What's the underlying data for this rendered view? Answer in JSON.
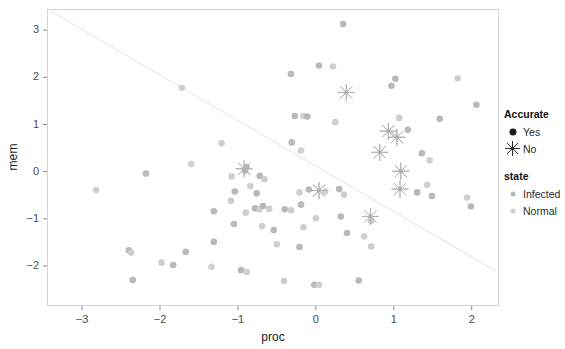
{
  "chart_data": {
    "type": "scatter",
    "title": "",
    "xlabel": "proc",
    "ylabel": "mem",
    "xlim": [
      -3.45,
      2.35
    ],
    "ylim": [
      -2.85,
      3.45
    ],
    "xticks": [
      -3,
      -2,
      -1,
      0,
      1,
      2
    ],
    "xticklabels": [
      "-3",
      "-2",
      "-1",
      "0",
      "1",
      "2"
    ],
    "yticks": [
      -2,
      -1,
      0,
      1,
      2,
      3
    ],
    "yticklabels": [
      "-2",
      "-1",
      "0",
      "1",
      "2",
      "3"
    ],
    "grid": false,
    "panel_border": true,
    "legend_position": "right",
    "reference_line": {
      "type": "line",
      "x": [
        -3.39,
        2.31
      ],
      "y": [
        3.39,
        -2.11
      ],
      "color": "#e8e8e8",
      "width": 1.2
    },
    "marker_colors": {
      "infected": "#b9b9b9",
      "normal": "#cfcfcf",
      "star": "#b0b0b0",
      "legend_yes": "#1a1a1a"
    },
    "series": [
      {
        "name": "Accurate = Yes",
        "marker": "circle",
        "points": [
          {
            "x": 0.35,
            "y": 3.13,
            "state": "Infected"
          },
          {
            "x": 0.04,
            "y": 2.25,
            "state": "Infected"
          },
          {
            "x": 0.22,
            "y": 2.23,
            "state": "Normal"
          },
          {
            "x": -0.32,
            "y": 2.07,
            "state": "Infected"
          },
          {
            "x": 1.02,
            "y": 1.97,
            "state": "Infected"
          },
          {
            "x": 1.82,
            "y": 1.98,
            "state": "Normal"
          },
          {
            "x": 0.97,
            "y": 1.82,
            "state": "Infected"
          },
          {
            "x": -1.72,
            "y": 1.78,
            "state": "Normal"
          },
          {
            "x": 2.06,
            "y": 1.42,
            "state": "Infected"
          },
          {
            "x": -0.27,
            "y": 1.18,
            "state": "Infected"
          },
          {
            "x": -0.16,
            "y": 1.18,
            "state": "Normal"
          },
          {
            "x": -0.11,
            "y": 1.17,
            "state": "Infected"
          },
          {
            "x": 1.07,
            "y": 1.14,
            "state": "Normal"
          },
          {
            "x": 1.59,
            "y": 1.12,
            "state": "Infected"
          },
          {
            "x": 0.25,
            "y": 1.05,
            "state": "Normal"
          },
          {
            "x": 1.18,
            "y": 0.89,
            "state": "Infected"
          },
          {
            "x": -1.21,
            "y": 0.6,
            "state": "Normal"
          },
          {
            "x": -0.31,
            "y": 0.62,
            "state": "Infected"
          },
          {
            "x": -0.19,
            "y": 0.45,
            "state": "Normal"
          },
          {
            "x": 1.36,
            "y": 0.39,
            "state": "Infected"
          },
          {
            "x": 1.46,
            "y": 0.24,
            "state": "Normal"
          },
          {
            "x": -0.89,
            "y": 0.1,
            "state": "Infected"
          },
          {
            "x": -1.6,
            "y": 0.16,
            "state": "Normal"
          },
          {
            "x": -0.91,
            "y": 0.02,
            "state": "Infected"
          },
          {
            "x": -1.08,
            "y": -0.1,
            "state": "Normal"
          },
          {
            "x": -0.72,
            "y": -0.09,
            "state": "Infected"
          },
          {
            "x": -0.66,
            "y": -0.16,
            "state": "Normal"
          },
          {
            "x": -2.18,
            "y": -0.04,
            "state": "Infected"
          },
          {
            "x": -2.82,
            "y": -0.39,
            "state": "Normal"
          },
          {
            "x": -1.04,
            "y": -0.42,
            "state": "Infected"
          },
          {
            "x": -0.84,
            "y": -0.31,
            "state": "Normal"
          },
          {
            "x": -0.76,
            "y": -0.46,
            "state": "Infected"
          },
          {
            "x": -0.21,
            "y": -0.44,
            "state": "Normal"
          },
          {
            "x": -0.09,
            "y": -0.38,
            "state": "Infected"
          },
          {
            "x": 0.12,
            "y": -0.42,
            "state": "Normal"
          },
          {
            "x": 0.3,
            "y": -0.37,
            "state": "Infected"
          },
          {
            "x": 0.36,
            "y": -0.49,
            "state": "Normal"
          },
          {
            "x": 1.3,
            "y": -0.44,
            "state": "Infected"
          },
          {
            "x": 1.43,
            "y": -0.28,
            "state": "Normal"
          },
          {
            "x": 1.49,
            "y": -0.52,
            "state": "Infected"
          },
          {
            "x": 1.94,
            "y": -0.55,
            "state": "Normal"
          },
          {
            "x": 1.99,
            "y": -0.74,
            "state": "Infected"
          },
          {
            "x": -1.09,
            "y": -0.62,
            "state": "Normal"
          },
          {
            "x": -0.78,
            "y": -0.78,
            "state": "Infected"
          },
          {
            "x": -0.72,
            "y": -0.8,
            "state": "Normal"
          },
          {
            "x": -0.68,
            "y": -0.73,
            "state": "Infected"
          },
          {
            "x": -0.6,
            "y": -0.79,
            "state": "Normal"
          },
          {
            "x": -0.4,
            "y": -0.8,
            "state": "Infected"
          },
          {
            "x": -0.32,
            "y": -0.82,
            "state": "Normal"
          },
          {
            "x": -0.19,
            "y": -0.7,
            "state": "Infected"
          },
          {
            "x": -0.9,
            "y": -0.87,
            "state": "Normal"
          },
          {
            "x": -1.31,
            "y": -0.84,
            "state": "Infected"
          },
          {
            "x": 0.0,
            "y": -0.99,
            "state": "Normal"
          },
          {
            "x": 0.32,
            "y": -0.95,
            "state": "Infected"
          },
          {
            "x": 0.71,
            "y": -1.04,
            "state": "Normal"
          },
          {
            "x": -1.05,
            "y": -1.11,
            "state": "Infected"
          },
          {
            "x": -0.69,
            "y": -1.16,
            "state": "Normal"
          },
          {
            "x": -0.54,
            "y": -1.24,
            "state": "Infected"
          },
          {
            "x": -0.16,
            "y": -1.18,
            "state": "Normal"
          },
          {
            "x": 0.4,
            "y": -1.3,
            "state": "Infected"
          },
          {
            "x": 0.62,
            "y": -1.37,
            "state": "Normal"
          },
          {
            "x": -1.31,
            "y": -1.49,
            "state": "Infected"
          },
          {
            "x": -0.5,
            "y": -1.54,
            "state": "Normal"
          },
          {
            "x": -0.21,
            "y": -1.6,
            "state": "Infected"
          },
          {
            "x": 0.71,
            "y": -1.59,
            "state": "Normal"
          },
          {
            "x": -2.4,
            "y": -1.67,
            "state": "Infected"
          },
          {
            "x": -2.37,
            "y": -1.72,
            "state": "Normal"
          },
          {
            "x": -1.67,
            "y": -1.7,
            "state": "Infected"
          },
          {
            "x": -1.98,
            "y": -1.93,
            "state": "Normal"
          },
          {
            "x": -1.83,
            "y": -1.98,
            "state": "Infected"
          },
          {
            "x": -1.34,
            "y": -2.02,
            "state": "Normal"
          },
          {
            "x": -0.96,
            "y": -2.09,
            "state": "Infected"
          },
          {
            "x": -0.89,
            "y": -2.13,
            "state": "Normal"
          },
          {
            "x": -2.35,
            "y": -2.3,
            "state": "Infected"
          },
          {
            "x": -0.41,
            "y": -2.32,
            "state": "Normal"
          },
          {
            "x": -0.02,
            "y": -2.4,
            "state": "Infected"
          },
          {
            "x": 0.04,
            "y": -2.4,
            "state": "Normal"
          },
          {
            "x": 0.55,
            "y": -2.31,
            "state": "Infected"
          }
        ]
      },
      {
        "name": "Accurate = No",
        "marker": "star",
        "points": [
          {
            "x": 0.39,
            "y": 1.68,
            "state": "Infected"
          },
          {
            "x": 0.93,
            "y": 0.86,
            "state": "Infected"
          },
          {
            "x": 1.04,
            "y": 0.73,
            "state": "Infected"
          },
          {
            "x": 0.82,
            "y": 0.41,
            "state": "Infected"
          },
          {
            "x": 1.09,
            "y": 0.01,
            "state": "Infected"
          },
          {
            "x": -0.92,
            "y": 0.06,
            "state": "Infected"
          },
          {
            "x": 1.08,
            "y": -0.37,
            "state": "Infected"
          },
          {
            "x": 0.04,
            "y": -0.4,
            "state": "Infected"
          },
          {
            "x": 0.7,
            "y": -0.95,
            "state": "Infected"
          }
        ]
      }
    ]
  },
  "legend": {
    "groups": [
      {
        "title": "Accurate",
        "items": [
          {
            "label": "Yes",
            "key": "dot-solid"
          },
          {
            "label": "No",
            "key": "star"
          }
        ]
      },
      {
        "title": "state",
        "items": [
          {
            "label": "Infected",
            "key": "dot-infected"
          },
          {
            "label": "Normal",
            "key": "dot-normal"
          }
        ]
      }
    ]
  }
}
